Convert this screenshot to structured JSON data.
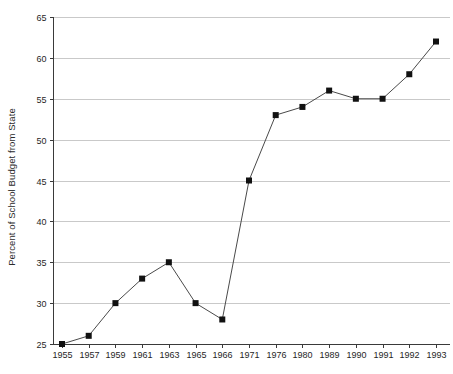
{
  "chart_data": {
    "type": "line",
    "title": "",
    "subtitle": "",
    "xlabel": "",
    "ylabel": "Percent of School Budget from State",
    "categories": [
      "1955",
      "1957",
      "1959",
      "1961",
      "1963",
      "1965",
      "1966",
      "1971",
      "1976",
      "1980",
      "1989",
      "1990",
      "1991",
      "1992",
      "1993"
    ],
    "values": [
      25,
      26,
      30,
      33,
      35,
      30,
      28,
      45,
      53,
      54,
      56,
      55,
      55,
      58,
      62
    ],
    "series": [
      {
        "name": "Percent of School Budget from State",
        "values": [
          25,
          26,
          30,
          33,
          35,
          30,
          28,
          45,
          53,
          54,
          56,
          55,
          55,
          58,
          62
        ]
      }
    ],
    "ylim": [
      25,
      65
    ],
    "yticks": [
      25,
      30,
      35,
      40,
      45,
      50,
      55,
      60,
      65
    ],
    "ytick_labels": [
      "25",
      "30",
      "35",
      "40",
      "45",
      "50",
      "55",
      "60",
      "65"
    ],
    "grid": true,
    "grid_axis": "y",
    "legend": false,
    "legend_position": "none",
    "marker": "square",
    "line_color": "#4a4a4a",
    "marker_color": "#111111",
    "grid_color": "#c9c9c9",
    "axis_color": "#3a3a3a",
    "background_color": "#ffffff"
  }
}
